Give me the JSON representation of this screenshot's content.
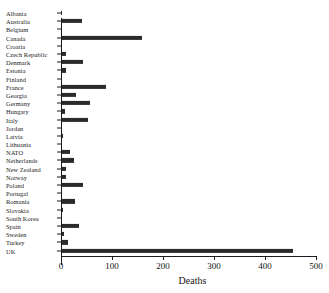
{
  "figure": {
    "cut_title": "",
    "background": "#ffffff",
    "bar_color": "#2b2b2b",
    "axis_color": "#1a1a1a"
  },
  "chart_data": {
    "type": "bar",
    "orientation": "horizontal",
    "title": "",
    "xlabel": "Deaths",
    "ylabel": "",
    "xlim": [
      0,
      500
    ],
    "xticks": [
      0,
      100,
      200,
      300,
      400,
      500
    ],
    "xticklabels": [
      "0",
      "100",
      "200",
      "300",
      "400",
      "500"
    ],
    "grid": false,
    "legend": null,
    "categories": [
      "Albania",
      "Australia",
      "Belgium",
      "Canada",
      "Croatia",
      "Czech Republic",
      "Denmark",
      "Estonia",
      "Finland",
      "France",
      "Georgia",
      "Germany",
      "Hungary",
      "Italy",
      "Jordan",
      "Latvia",
      "Lithuania",
      "NATO",
      "Netherlands",
      "New Zealand",
      "Norway",
      "Poland",
      "Portugal",
      "Romania",
      "Slovakia",
      "South Korea",
      "Spain",
      "Sweden",
      "Turkey",
      "UK"
    ],
    "values": [
      1,
      41,
      1,
      158,
      0,
      10,
      43,
      9,
      2,
      89,
      30,
      57,
      7,
      53,
      0,
      3,
      1,
      18,
      25,
      10,
      10,
      44,
      2,
      27,
      3,
      1,
      35,
      5,
      14,
      455
    ]
  }
}
